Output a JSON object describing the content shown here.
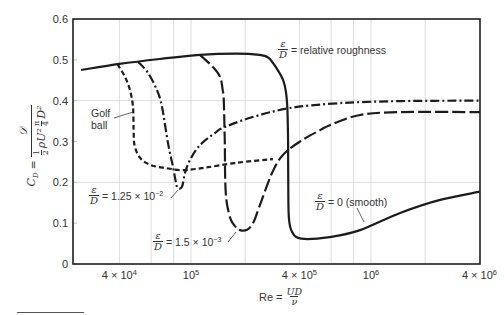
{
  "chart_data": {
    "type": "line",
    "title": "",
    "xlabel": "Re = UD/ν",
    "ylabel": "C_D = 𝒟 / (½ ρU² (π/4) D²)",
    "xscale": "log",
    "xlim": [
      22100,
      4030000
    ],
    "ylim": [
      0,
      0.6
    ],
    "grid": {
      "x": [
        40000,
        60000,
        80000,
        100000,
        200000,
        400000,
        600000,
        800000,
        1000000,
        2000000
      ],
      "y": [
        0.2,
        0.4
      ]
    },
    "x_ticks": [
      {
        "value": 40000,
        "base": "4 × 10",
        "exp": "4"
      },
      {
        "value": 100000,
        "base": "10",
        "exp": "5"
      },
      {
        "value": 400000,
        "base": "4 × 10",
        "exp": "5"
      },
      {
        "value": 1000000,
        "base": "10",
        "exp": "6"
      },
      {
        "value": 4000000,
        "base": "4 × 10",
        "exp": "6"
      }
    ],
    "y_ticks": [
      {
        "value": 0,
        "label": "0"
      },
      {
        "value": 0.1,
        "label": "0.1"
      },
      {
        "value": 0.2,
        "label": "0.2"
      },
      {
        "value": 0.3,
        "label": "0.3"
      },
      {
        "value": 0.4,
        "label": "0.4"
      },
      {
        "value": 0.5,
        "label": "0.5"
      },
      {
        "value": 0.6,
        "label": "0.6"
      }
    ],
    "legend": "none (curves labeled inline)",
    "series": [
      {
        "key": "smooth",
        "name": "ε/D = 0 (smooth)",
        "line_style": "solid",
        "points": [
          [
            24500,
            0.475
          ],
          [
            40000,
            0.49
          ],
          [
            67000,
            0.502
          ],
          [
            112000,
            0.512
          ],
          [
            180000,
            0.515
          ],
          [
            240000,
            0.512
          ],
          [
            270000,
            0.505
          ],
          [
            300000,
            0.478
          ],
          [
            325000,
            0.45
          ],
          [
            337000,
            0.42
          ],
          [
            343000,
            0.38
          ],
          [
            346000,
            0.3
          ],
          [
            347000,
            0.18
          ],
          [
            350000,
            0.11
          ],
          [
            365000,
            0.078
          ],
          [
            410000,
            0.062
          ],
          [
            590000,
            0.066
          ],
          [
            870000,
            0.083
          ],
          [
            1450000,
            0.125
          ],
          [
            2420000,
            0.157
          ],
          [
            4030000,
            0.177
          ]
        ]
      },
      {
        "key": "golf-ball",
        "name": "Golf ball",
        "line_style": "dashed",
        "points": [
          [
            39000,
            0.49
          ],
          [
            43000,
            0.458
          ],
          [
            45800,
            0.426
          ],
          [
            47600,
            0.385
          ],
          [
            48000,
            0.33
          ],
          [
            48600,
            0.29
          ],
          [
            52100,
            0.26
          ],
          [
            59200,
            0.243
          ],
          [
            71700,
            0.235
          ],
          [
            90300,
            0.23
          ],
          [
            120000,
            0.236
          ],
          [
            180000,
            0.248
          ],
          [
            285000,
            0.257
          ]
        ]
      },
      {
        "key": "rough-1-25e-2",
        "name": "ε/D = 1.25 × 10⁻²",
        "line_style": "dashdot",
        "points": [
          [
            51000,
            0.495
          ],
          [
            57700,
            0.468
          ],
          [
            64700,
            0.426
          ],
          [
            69000,
            0.385
          ],
          [
            74500,
            0.296
          ],
          [
            79400,
            0.238
          ],
          [
            82600,
            0.198
          ],
          [
            84500,
            0.186
          ],
          [
            89100,
            0.189
          ],
          [
            92600,
            0.223
          ],
          [
            98700,
            0.255
          ],
          [
            112000,
            0.291
          ],
          [
            136000,
            0.321
          ],
          [
            150000,
            0.333
          ],
          [
            213000,
            0.358
          ],
          [
            355000,
            0.382
          ],
          [
            673000,
            0.394
          ],
          [
            1450000,
            0.399
          ],
          [
            4030000,
            0.4
          ]
        ]
      },
      {
        "key": "rough-1-5e-3",
        "name": "ε/D = 1.5 × 10⁻³",
        "line_style": "longdash",
        "points": [
          [
            112000,
            0.512
          ],
          [
            132000,
            0.483
          ],
          [
            145000,
            0.458
          ],
          [
            150000,
            0.426
          ],
          [
            152000,
            0.4
          ],
          [
            154000,
            0.3
          ],
          [
            155000,
            0.2
          ],
          [
            158000,
            0.15
          ],
          [
            166000,
            0.11
          ],
          [
            176000,
            0.092
          ],
          [
            187000,
            0.083
          ],
          [
            205000,
            0.084
          ],
          [
            221000,
            0.1
          ],
          [
            236000,
            0.132
          ],
          [
            282000,
            0.223
          ],
          [
            324000,
            0.267
          ],
          [
            403000,
            0.3
          ],
          [
            521000,
            0.328
          ],
          [
            591000,
            0.34
          ],
          [
            868000,
            0.365
          ],
          [
            1450000,
            0.372
          ],
          [
            4030000,
            0.372
          ]
        ]
      }
    ],
    "annotations": [
      {
        "key": "relative-roughness",
        "frac_num": "ε",
        "frac_den": "D",
        "text": "= relative roughness"
      },
      {
        "key": "golf-ball",
        "line1": "Golf",
        "line2": "ball"
      },
      {
        "key": "rough-1-25e-2",
        "frac_num": "ε",
        "frac_den": "D",
        "text": "= 1.25 × 10",
        "exp": "−2"
      },
      {
        "key": "rough-1-5e-3",
        "frac_num": "ε",
        "frac_den": "D",
        "text": "= 1.5 × 10",
        "exp": "−3"
      },
      {
        "key": "smooth",
        "frac_num": "ε",
        "frac_den": "D",
        "text": "= 0 (smooth)"
      }
    ]
  },
  "axis_labels": {
    "y": {
      "lhs": "C",
      "lhs_sub": "D",
      "eq": "=",
      "numerator": "𝒟",
      "half_num": "1",
      "half_den": "2",
      "rho_u": "ρU²",
      "pi_num": "π",
      "pi_den": "4",
      "d_sq": "D²"
    },
    "x": {
      "lhs": "Re =",
      "num": "UD",
      "den": "ν"
    }
  }
}
